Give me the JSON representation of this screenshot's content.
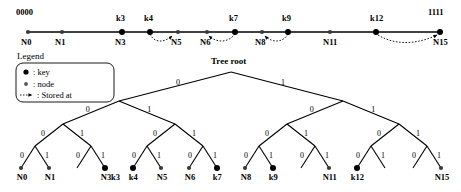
{
  "ring": {
    "endpoint_left": "0000",
    "endpoint_right": "1111",
    "nodes": [
      {
        "x": 28,
        "label": "N1x",
        "bottom": "N0",
        "top": "",
        "type": "node"
      },
      {
        "x": 62,
        "label": "",
        "bottom": "N1",
        "top": "",
        "type": "node"
      },
      {
        "x": 122,
        "label": "",
        "bottom": "N3",
        "top": "k3",
        "type": "key"
      },
      {
        "x": 150,
        "label": "",
        "bottom": "",
        "top": "k4",
        "type": "key"
      },
      {
        "x": 178,
        "label": "",
        "bottom": "N5",
        "top": "",
        "type": "node"
      },
      {
        "x": 207,
        "label": "",
        "bottom": "N6",
        "top": "",
        "type": "node"
      },
      {
        "x": 235,
        "label": "",
        "bottom": "",
        "top": "k7",
        "type": "key"
      },
      {
        "x": 262,
        "label": "",
        "bottom": "N8",
        "top": "",
        "type": "node"
      },
      {
        "x": 288,
        "label": "",
        "bottom": "",
        "top": "k9",
        "type": "key"
      },
      {
        "x": 330,
        "label": "",
        "bottom": "N11",
        "top": "",
        "type": "node"
      },
      {
        "x": 376,
        "label": "",
        "bottom": "",
        "top": "k12",
        "type": "key"
      },
      {
        "x": 440,
        "label": "",
        "bottom": "N15",
        "top": "",
        "type": "key"
      }
    ],
    "stored_at_arrows": [
      {
        "from": "k4",
        "to": "N5"
      },
      {
        "from": "k7",
        "to": "N6"
      },
      {
        "from": "k9",
        "to": "N8"
      },
      {
        "from": "k12",
        "to": "N15"
      }
    ]
  },
  "legend": {
    "title": "Legend",
    "entries": [
      {
        "symbol": "key-dot",
        "text": ": key"
      },
      {
        "symbol": "node-dot",
        "text": ": node"
      },
      {
        "symbol": "dashed-arrow",
        "text": ": Stored at"
      }
    ]
  },
  "tree": {
    "root_label": "Tree root",
    "edge_labels": [
      "0",
      "1"
    ],
    "leaves": [
      {
        "x": 21,
        "label": "N0",
        "type": "node"
      },
      {
        "x": 49,
        "label": "N1",
        "type": "node"
      },
      {
        "x": 77,
        "label": "",
        "type": "none"
      },
      {
        "x": 105,
        "label": "N3",
        "label2": "k3",
        "type": "key"
      },
      {
        "x": 133,
        "label": "k4",
        "type": "key"
      },
      {
        "x": 161,
        "label": "N5",
        "type": "node"
      },
      {
        "x": 189,
        "label": "N6",
        "type": "node"
      },
      {
        "x": 217,
        "label": "k7",
        "type": "key"
      },
      {
        "x": 245,
        "label": "N8",
        "type": "node"
      },
      {
        "x": 273,
        "label": "k9",
        "type": "key"
      },
      {
        "x": 301,
        "label": "",
        "type": "none"
      },
      {
        "x": 329,
        "label": "N11",
        "type": "node"
      },
      {
        "x": 357,
        "label": "k12",
        "type": "key"
      },
      {
        "x": 385,
        "label": "",
        "type": "none"
      },
      {
        "x": 413,
        "label": "",
        "type": "none"
      },
      {
        "x": 441,
        "label": "N15",
        "type": "node"
      }
    ]
  },
  "colors": {
    "ink": "#000000",
    "background": "#ffffff"
  }
}
